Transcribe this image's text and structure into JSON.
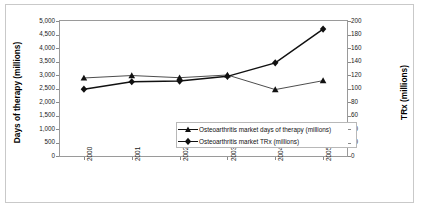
{
  "chart_data": {
    "type": "line",
    "title": "",
    "xlabel": "",
    "ylabel": "Days of therapy (millions)",
    "y2label": "TRx (millions)",
    "categories": [
      "2000",
      "2001",
      "2002",
      "2003",
      "2004",
      "2005"
    ],
    "ylim": [
      0,
      5000
    ],
    "y2lim": [
      0,
      200
    ],
    "yticks": [
      "0",
      "500",
      "1,000",
      "1,500",
      "2,000",
      "2,500",
      "3,000",
      "3,500",
      "4,000",
      "4,500",
      "5,000"
    ],
    "ytick_values": [
      0,
      500,
      1000,
      1500,
      2000,
      2500,
      3000,
      3500,
      4000,
      4500,
      5000
    ],
    "y2ticks": [
      "0",
      "20",
      "40",
      "60",
      "80",
      "100",
      "120",
      "140",
      "160",
      "180",
      "200"
    ],
    "y2tick_values": [
      0,
      20,
      40,
      60,
      80,
      100,
      120,
      140,
      160,
      180,
      200
    ],
    "grid": false,
    "legend_position": "center",
    "series": [
      {
        "name": "Osteoarthritis market days of therapy (millions)",
        "axis": "left",
        "marker": "triangle",
        "color": "#111111",
        "values": [
          2890,
          2980,
          2900,
          3000,
          2460,
          2790
        ]
      },
      {
        "name": "Osteoarthritis market TRx (millions)",
        "axis": "right",
        "marker": "diamond",
        "color": "#111111",
        "values": [
          99,
          110,
          111,
          118,
          138,
          188
        ]
      }
    ]
  },
  "legend": {
    "entries": [
      {
        "label": "Osteoarthritis market days of therapy (millions)"
      },
      {
        "label": "Osteoarthritis market TRx (millions)"
      }
    ]
  }
}
